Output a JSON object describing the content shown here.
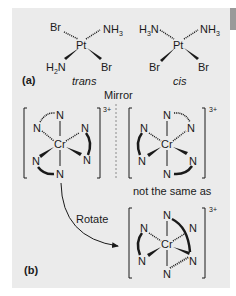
{
  "figure": {
    "part_a": {
      "label": "(a)",
      "trans": {
        "caption": "trans",
        "center": "Pt",
        "ligands": {
          "top_left": "Br",
          "top_right": "NH",
          "top_right_sub": "3",
          "bottom_left": "N",
          "bottom_left_pre": "H",
          "bottom_left_sub": "2",
          "bottom_right": "Br"
        }
      },
      "cis": {
        "caption": "cis",
        "center": "Pt",
        "ligands": {
          "top_left_pre": "H",
          "top_left_sub": "3",
          "top_left": "N",
          "top_right": "NH",
          "top_right_sub": "3",
          "bottom_left": "Br",
          "bottom_right": "Br"
        }
      }
    },
    "part_b": {
      "label": "(b)",
      "mirror_label": "Mirror",
      "not_same_label": "not the same as",
      "rotate_label": "Rotate",
      "center": "Cr",
      "donor": "N",
      "charge": "3+"
    }
  },
  "colors": {
    "panel": "#ebebeb",
    "ink": "#1a1a1a",
    "mirror_line": "#8a8a8a"
  }
}
